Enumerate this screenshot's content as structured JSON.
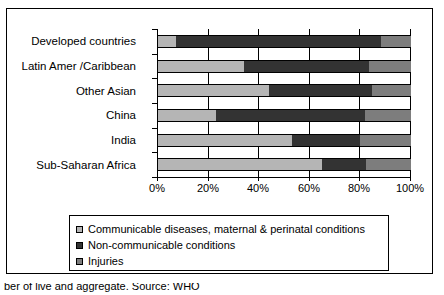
{
  "chart_data": {
    "type": "bar",
    "orientation": "horizontal",
    "stacked": true,
    "normalized": true,
    "title": "",
    "subtitle": "",
    "xlabel": "",
    "ylabel": "",
    "xlim": [
      0,
      100
    ],
    "xtick_labels": [
      "0%",
      "20%",
      "40%",
      "60%",
      "80%",
      "100%"
    ],
    "xtick_values": [
      0,
      20,
      40,
      60,
      80,
      100
    ],
    "grid": true,
    "grid_axis": "x",
    "legend_position": "bottom",
    "categories": [
      "Developed countries",
      "Latin Amer /Caribbean",
      "Other Asian",
      "China",
      "India",
      "Sub-Saharan Africa"
    ],
    "series": [
      {
        "name": "Communicable diseases, maternal & perinatal conditions",
        "color": "#b5b5b5",
        "values": [
          7,
          34,
          44,
          23,
          53,
          65
        ]
      },
      {
        "name": "Non-communicable conditions",
        "color": "#333333",
        "values": [
          81,
          49.5,
          40.6,
          58.8,
          27,
          17.4
        ]
      },
      {
        "name": "Injuries",
        "color": "#7d7d7d",
        "values": [
          12,
          16.5,
          15.4,
          18.2,
          20,
          17.6
        ]
      }
    ]
  },
  "legend": {
    "items": [
      {
        "label": "Communicable diseases, maternal & perinatal conditions",
        "swatch": "legend-swatch-communicable"
      },
      {
        "label": "Non-communicable conditions",
        "swatch": "legend-swatch-noncommunicable"
      },
      {
        "label": "Injuries",
        "swatch": "legend-swatch-injuries"
      }
    ]
  },
  "caption": {
    "text": "ber of live and aggregate. Source: WHO"
  }
}
